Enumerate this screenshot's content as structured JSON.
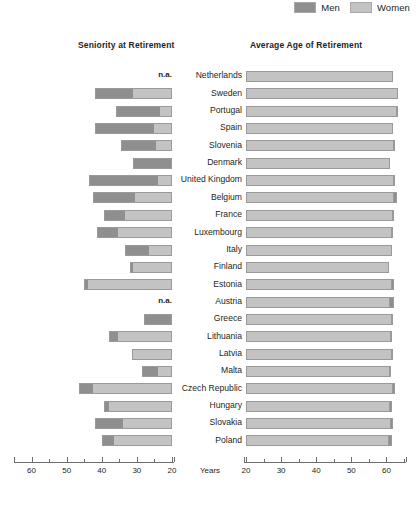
{
  "legend": {
    "entries": [
      {
        "label": "Men",
        "color": "#8f8f8f",
        "icon": "legend-swatch-men"
      },
      {
        "label": "Women",
        "color": "#c3c3c3",
        "icon": "legend-swatch-women"
      }
    ]
  },
  "panels": {
    "left": {
      "title": "Seniority at Retirement"
    },
    "right": {
      "title": "Average Age of Retirement"
    }
  },
  "axis_label": "Years",
  "na_text": "n.a.",
  "chart_data": {
    "type": "bar",
    "orientation": "horizontal",
    "layout": "two-panel bidirectional (left panel axis reversed, bars right-aligned at 20; right panel bars left-aligned at 20)",
    "xlabel": "Years",
    "ylabel": "",
    "grid": false,
    "legend_position": "top-right",
    "series": [
      {
        "name": "Men",
        "color": "#8f8f8f"
      },
      {
        "name": "Women",
        "color": "#c3c3c3"
      }
    ],
    "panels": [
      {
        "name": "Seniority at Retirement",
        "axis_reversed": true,
        "xlim": [
          65,
          18
        ],
        "ticks_major": [
          60,
          50,
          40,
          30,
          20
        ],
        "ticks_minor": [
          65,
          55,
          45,
          35,
          25
        ],
        "ticklabels": [
          "60",
          "50",
          "40",
          "30",
          "20"
        ],
        "baseline": 20,
        "note": "Stacked bar: Men segment then Women segment, extending leftward from the value-20 baseline."
      },
      {
        "name": "Average Age of Retirement",
        "axis_reversed": false,
        "xlim": [
          18,
          65
        ],
        "ticks_major": [
          20,
          30,
          40,
          50,
          60
        ],
        "ticks_minor": [
          25,
          35,
          45,
          55,
          65
        ],
        "ticklabels": [
          "20",
          "30",
          "40",
          "50",
          "60"
        ],
        "baseline": 20,
        "note": "Overlapping bars: Women bar drawn to its value, Men bar overlaid; visible dark tail shows whichever sex retires later."
      }
    ],
    "categories": [
      "Netherlands",
      "Sweden",
      "Portugal",
      "Spain",
      "Slovenia",
      "Denmark",
      "United Kingdom",
      "Belgium",
      "France",
      "Luxembourg",
      "Italy",
      "Finland",
      "Estonia",
      "Austria",
      "Greece",
      "Lithuania",
      "Latvia",
      "Malta",
      "Czech Republic",
      "Hungary",
      "Slovakia",
      "Poland"
    ],
    "rows": [
      {
        "country": "Netherlands",
        "seniority": {
          "men": null,
          "women": null,
          "na": true
        },
        "retirement_age": {
          "men": 62.0,
          "women": 62.0
        }
      },
      {
        "country": "Sweden",
        "seniority": {
          "men": 42.0,
          "women": 31.0,
          "na": false
        },
        "retirement_age": {
          "men": 63.3,
          "women": 63.3
        }
      },
      {
        "country": "Portugal",
        "seniority": {
          "men": 36.0,
          "women": 23.5,
          "na": false
        },
        "retirement_age": {
          "men": 63.3,
          "women": 62.8
        }
      },
      {
        "country": "Spain",
        "seniority": {
          "men": 42.0,
          "women": 25.0,
          "na": false
        },
        "retirement_age": {
          "men": 62.0,
          "women": 62.0
        }
      },
      {
        "country": "Slovenia",
        "seniority": {
          "men": 34.5,
          "women": 24.5,
          "na": false
        },
        "retirement_age": {
          "men": 62.4,
          "women": 61.9
        }
      },
      {
        "country": "Denmark",
        "seniority": {
          "men": 31.0,
          "women": 20.0,
          "na": false
        },
        "retirement_age": {
          "men": 61.0,
          "women": 61.0
        }
      },
      {
        "country": "United Kingdom",
        "seniority": {
          "men": 43.5,
          "women": 24.0,
          "na": false
        },
        "retirement_age": {
          "men": 62.5,
          "women": 62.0
        }
      },
      {
        "country": "Belgium",
        "seniority": {
          "men": 42.5,
          "women": 30.5,
          "na": false
        },
        "retirement_age": {
          "men": 62.9,
          "women": 61.8
        }
      },
      {
        "country": "France",
        "seniority": {
          "men": 39.5,
          "women": 33.5,
          "na": false
        },
        "retirement_age": {
          "men": 62.1,
          "women": 61.5
        }
      },
      {
        "country": "Luxembourg",
        "seniority": {
          "men": 41.5,
          "women": 35.5,
          "na": false
        },
        "retirement_age": {
          "men": 61.9,
          "women": 61.5
        }
      },
      {
        "country": "Italy",
        "seniority": {
          "men": 33.5,
          "women": 26.5,
          "na": false
        },
        "retirement_age": {
          "men": 61.5,
          "women": 61.5
        }
      },
      {
        "country": "Finland",
        "seniority": {
          "men": 32.0,
          "women": 31.0,
          "na": false
        },
        "retirement_age": {
          "men": 60.7,
          "women": 60.7
        }
      },
      {
        "country": "Estonia",
        "seniority": {
          "men": 45.0,
          "women": 44.0,
          "na": false
        },
        "retirement_age": {
          "men": 62.1,
          "women": 61.2
        }
      },
      {
        "country": "Austria",
        "seniority": {
          "men": null,
          "women": null,
          "na": true
        },
        "retirement_age": {
          "men": 62.2,
          "women": 60.7
        }
      },
      {
        "country": "Greece",
        "seniority": {
          "men": 28.0,
          "women": 20.0,
          "na": false
        },
        "retirement_age": {
          "men": 62.0,
          "women": 61.4
        }
      },
      {
        "country": "Lithuania",
        "seniority": {
          "men": 38.0,
          "women": 35.5,
          "na": false
        },
        "retirement_age": {
          "men": 61.7,
          "women": 61.3
        }
      },
      {
        "country": "Latvia",
        "seniority": {
          "men": 31.5,
          "women": 31.0,
          "na": false
        },
        "retirement_age": {
          "men": 61.8,
          "women": 61.3
        }
      },
      {
        "country": "Malta",
        "seniority": {
          "men": 28.5,
          "women": 24.0,
          "na": false
        },
        "retirement_age": {
          "men": 61.2,
          "women": 60.8
        }
      },
      {
        "country": "Czech Republic",
        "seniority": {
          "men": 46.5,
          "women": 42.5,
          "na": false
        },
        "retirement_age": {
          "men": 62.3,
          "women": 61.6
        }
      },
      {
        "country": "Hungary",
        "seniority": {
          "men": 39.5,
          "women": 38.0,
          "na": false
        },
        "retirement_age": {
          "men": 61.5,
          "women": 60.6
        }
      },
      {
        "country": "Slovakia",
        "seniority": {
          "men": 42.0,
          "women": 34.0,
          "na": false
        },
        "retirement_age": {
          "men": 61.8,
          "women": 61.1
        }
      },
      {
        "country": "Poland",
        "seniority": {
          "men": 40.0,
          "women": 36.5,
          "na": false
        },
        "retirement_age": {
          "men": 61.5,
          "women": 60.4
        }
      }
    ]
  }
}
